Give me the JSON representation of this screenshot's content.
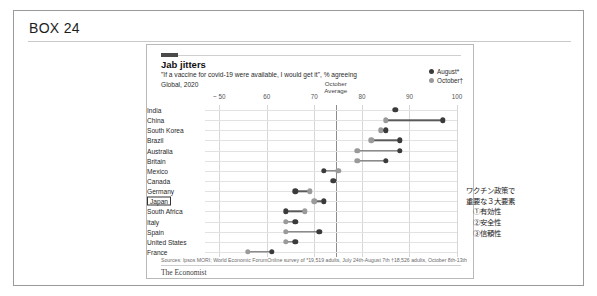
{
  "box": {
    "label": "BOX 24"
  },
  "chart": {
    "title": "Jab jitters",
    "subtitle": "\"If a vaccine for covid-19 were available, I would get it\", % agreeing",
    "scope": "Global, 2020",
    "legend": [
      {
        "label": "August*",
        "color": "#3b3b3b"
      },
      {
        "label": "October†",
        "color": "#9a9a9a"
      }
    ],
    "source_left": "Sources: Ipsos MORI; World Economic Forum",
    "source_right": "Online survey of  *19,519 adults, July 24th-August 7th   †18,526 adults, October 8th-13th",
    "brand": "The Economist",
    "average_label_line1": "October",
    "average_label_line2": "Average"
  },
  "chart_data": {
    "type": "scatter",
    "title": "Jab jitters",
    "subtitle": "\"If a vaccine for covid-19 were available, I would get it\", % agreeing",
    "xlabel": "",
    "ylabel": "",
    "xlim": [
      47,
      100
    ],
    "xticks": [
      50,
      60,
      70,
      80,
      90,
      100
    ],
    "xticklabels": [
      "~ 50",
      "60",
      "70",
      "80",
      "90",
      "100"
    ],
    "grid": true,
    "legend_position": "top-right",
    "october_average": 74.5,
    "categories": [
      "India",
      "China",
      "South Korea",
      "Brazil",
      "Australia",
      "Britain",
      "Mexico",
      "Canada",
      "Germany",
      "Japan",
      "South Africa",
      "Italy",
      "Spain",
      "United States",
      "France"
    ],
    "highlighted_category": "Japan",
    "series": [
      {
        "name": "August*",
        "color": "#3b3b3b",
        "values": [
          87,
          97,
          85,
          88,
          88,
          85,
          72,
          74,
          66,
          72,
          64,
          66,
          71,
          66,
          61
        ]
      },
      {
        "name": "October†",
        "color": "#9a9a9a",
        "values": [
          null,
          85,
          84,
          82,
          79,
          79,
          75,
          null,
          69,
          70,
          68,
          64,
          64,
          64,
          56
        ]
      }
    ]
  },
  "annotation": {
    "lines": [
      "ワクチン政策で",
      "重要な３大要素",
      "①有効性",
      "②安全性",
      "③信頼性"
    ]
  }
}
